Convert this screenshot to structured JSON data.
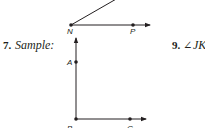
{
  "figure_top": {
    "vertex_label": "N",
    "point_label": "P",
    "description": "Angle with vertex N; one ray through P pointing right, other ray extending up and to the right"
  },
  "exercise_7": {
    "number": "7.",
    "label": "Sample:",
    "figure": {
      "vertex_label": "B",
      "point_labels": [
        "A",
        "C"
      ],
      "description": "Right angle ABC: ray BA pointing up, ray BC pointing right"
    }
  },
  "exercise_9": {
    "number": "9.",
    "angle_symbol": "∠",
    "angle_name": "JKL"
  },
  "colors": {
    "ink": "#231f20",
    "background": "#ffffff"
  }
}
